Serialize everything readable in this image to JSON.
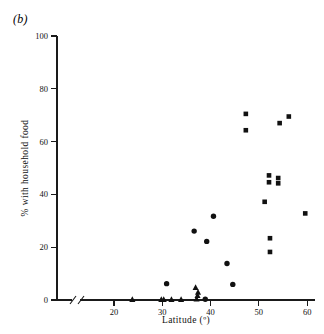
{
  "figure": {
    "panel_label": "(b)",
    "background_color": "#ffffff",
    "marker_color": "#111111"
  },
  "chart_data": {
    "type": "scatter",
    "title": "",
    "subtitle": "",
    "xlabel": "Latitude (º)",
    "ylabel": "% with household food",
    "xlim": [
      14,
      61
    ],
    "ylim": [
      0,
      100
    ],
    "xticks": [
      20,
      30,
      40,
      50,
      60
    ],
    "xtick_labels": [
      "20",
      "30",
      "40",
      "50",
      "60"
    ],
    "yticks": [
      0,
      20,
      40,
      60,
      80,
      100
    ],
    "ytick_labels": [
      "0",
      "20",
      "40",
      "60",
      "80",
      "100"
    ],
    "grid": false,
    "legend": false,
    "legend_position": "none",
    "axis_break": {
      "axis": "x",
      "present": true,
      "note": "double-slash break between origin and first data region"
    },
    "annotations": [
      {
        "text": "(b)",
        "x_px": 13,
        "y_px": 12,
        "style": "italic"
      }
    ],
    "series": [
      {
        "name": "square",
        "marker": "square",
        "points": [
          {
            "x": 47.3,
            "y": 70.5
          },
          {
            "x": 47.3,
            "y": 64.3
          },
          {
            "x": 54.3,
            "y": 67.0
          },
          {
            "x": 56.2,
            "y": 69.5
          },
          {
            "x": 52.1,
            "y": 47.2
          },
          {
            "x": 52.1,
            "y": 44.6
          },
          {
            "x": 54.0,
            "y": 46.2
          },
          {
            "x": 54.0,
            "y": 44.2
          },
          {
            "x": 51.2,
            "y": 37.2
          },
          {
            "x": 59.6,
            "y": 32.8
          },
          {
            "x": 52.3,
            "y": 23.4
          },
          {
            "x": 52.3,
            "y": 18.2
          }
        ]
      },
      {
        "name": "circle",
        "marker": "circle",
        "points": [
          {
            "x": 40.6,
            "y": 31.7
          },
          {
            "x": 36.6,
            "y": 26.1
          },
          {
            "x": 39.2,
            "y": 22.2
          },
          {
            "x": 43.4,
            "y": 13.8
          },
          {
            "x": 44.6,
            "y": 5.9
          },
          {
            "x": 30.9,
            "y": 6.2
          },
          {
            "x": 38.9,
            "y": 0.3
          }
        ]
      },
      {
        "name": "triangle",
        "marker": "triangle",
        "points": [
          {
            "x": 36.9,
            "y": 4.8
          },
          {
            "x": 37.4,
            "y": 3.0
          },
          {
            "x": 37.3,
            "y": 1.7
          },
          {
            "x": 37.1,
            "y": 0.4
          },
          {
            "x": 23.8,
            "y": 0.2
          },
          {
            "x": 29.8,
            "y": 0.2
          },
          {
            "x": 30.3,
            "y": 0.2
          },
          {
            "x": 31.9,
            "y": 0.2
          },
          {
            "x": 33.9,
            "y": 0.2
          }
        ]
      }
    ]
  }
}
